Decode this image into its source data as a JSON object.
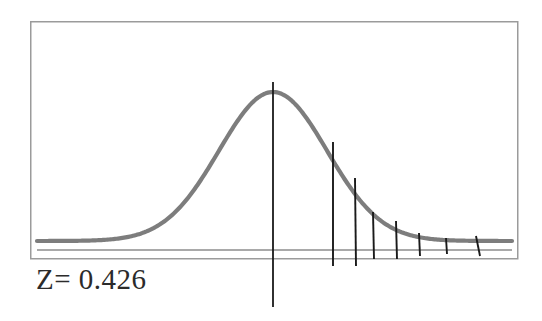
{
  "figure": {
    "type": "normal-distribution-curve",
    "caption": "Z= 0.426",
    "frame": {
      "x": 30,
      "y": 21,
      "width": 487,
      "height": 237,
      "border_color": "#9b9b9b",
      "border_width": 1.5,
      "fill_color": "#ffffff"
    },
    "curve": {
      "name": "bell-curve",
      "color": "#7d7d7d",
      "stroke_width": 4.2,
      "peak_x": 273,
      "peak_y": 92,
      "baseline_y": 241,
      "left_x": 37,
      "right_x": 512,
      "sigma_px": 54
    },
    "axis_line": {
      "name": "baseline-axis",
      "color": "#8c8c8c",
      "stroke_width": 1.4,
      "y": 250,
      "x1": 37,
      "x2": 512
    },
    "center_line": {
      "name": "mean-vertical-line",
      "color": "#1a1a1a",
      "stroke_width": 1.8,
      "x": 273,
      "y_top": 82,
      "y_bottom": 307
    },
    "tick_lines": [
      {
        "x1": 333,
        "y1": 142,
        "x2": 333,
        "y2": 266,
        "label": "tick-1"
      },
      {
        "x1": 355,
        "y1": 178,
        "x2": 356,
        "y2": 266,
        "label": "tick-2"
      },
      {
        "x1": 373,
        "y1": 212,
        "x2": 374,
        "y2": 259,
        "label": "tick-3"
      },
      {
        "x1": 396,
        "y1": 221,
        "x2": 397,
        "y2": 259,
        "label": "tick-4"
      },
      {
        "x1": 419,
        "y1": 233,
        "x2": 420,
        "y2": 256,
        "label": "tick-5"
      },
      {
        "x1": 446,
        "y1": 238,
        "x2": 447,
        "y2": 254,
        "label": "tick-6"
      },
      {
        "x1": 476,
        "y1": 236,
        "x2": 480,
        "y2": 256,
        "label": "tick-7"
      }
    ],
    "tick_color": "#1a1a1a",
    "tick_stroke_width": 1.9
  },
  "chart_data": {
    "type": "line",
    "title": "",
    "subtitle": "",
    "xlabel": "",
    "ylabel": "",
    "annotations": [
      {
        "text": "Z= 0.426",
        "x": 36,
        "y": 268,
        "role": "z-score-label"
      }
    ],
    "legend": [],
    "grid": false,
    "series": [
      {
        "name": "standard-normal-density",
        "shape": "gaussian",
        "mean_px_x": 273,
        "peak_px_y": 92,
        "baseline_px_y": 241,
        "sigma_px": 54,
        "color": "#7d7d7d"
      }
    ],
    "markers": {
      "mean_line_x_px": 273,
      "z_value": 0.426,
      "tail_tick_x_px": [
        333,
        355,
        373,
        396,
        419,
        446,
        478
      ],
      "tail_tick_top_y_px": [
        142,
        178,
        212,
        221,
        233,
        238,
        236
      ]
    },
    "xlim_px": [
      37,
      512
    ],
    "ylim_px": [
      241,
      92
    ]
  }
}
